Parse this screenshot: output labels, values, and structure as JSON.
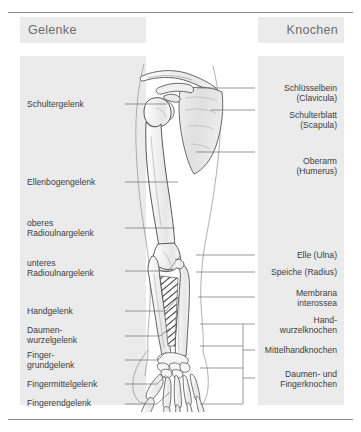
{
  "figure": {
    "title_left": "Gelenke",
    "title_right": "Knochen",
    "language": "de"
  },
  "columns": {
    "left": {
      "heading": "Gelenke",
      "align": "left",
      "items": [
        {
          "label": "Schultergelenk",
          "y": 104
        },
        {
          "label": "Ellenbogengelenk",
          "y": 182
        },
        {
          "label": "oberes\nRadioulnargelenk",
          "y": 228
        },
        {
          "label": "unteres\nRadioulnargelenk",
          "y": 268
        },
        {
          "label": "Handgelenk",
          "y": 311
        },
        {
          "label": "Daumen-\nwurzelgelenk",
          "y": 334
        },
        {
          "label": "Finger-\ngrundgelenk",
          "y": 359
        },
        {
          "label": "Fingermittelgelenk",
          "y": 384
        },
        {
          "label": "Fingerendgelenk",
          "y": 403
        }
      ]
    },
    "right": {
      "heading": "Knochen",
      "align": "right",
      "items": [
        {
          "label": "Schlüsselbein\n(Clavicula)",
          "y": 89
        },
        {
          "label": "Schulterblatt\n(Scapula)",
          "y": 117
        },
        {
          "label": "Oberarm\n(Humerus)",
          "y": 163
        },
        {
          "label": "Elle (Ulna)",
          "y": 255
        },
        {
          "label": "Speiche (Radius)",
          "y": 271
        },
        {
          "label": "Membrana\ninterossea",
          "y": 295
        },
        {
          "label": "Hand-\nwurzelknochen",
          "y": 322
        },
        {
          "label": "Mittelhandknochen",
          "y": 350
        },
        {
          "label": "Daumen- und\nFingerknochen",
          "y": 374
        }
      ]
    }
  },
  "colors": {
    "panel": "#ebebeb",
    "heading_text": "#6d6d6d",
    "label_text": "#3d3d3d",
    "rule": "#8d8d8d",
    "leader": "#6f6f6f",
    "bone_outline": "#5a5a5a",
    "bone_fill": "#fbfbfb",
    "shade": "#e3e3e3",
    "background": "#ffffff"
  },
  "illustration": {
    "name": "arm-skeleton-anterior-view",
    "parts": [
      "Clavicula",
      "Scapula",
      "Humerus",
      "Ulna",
      "Radius",
      "Membrana interossea",
      "Carpus",
      "Metacarpus",
      "Phalanges"
    ]
  }
}
